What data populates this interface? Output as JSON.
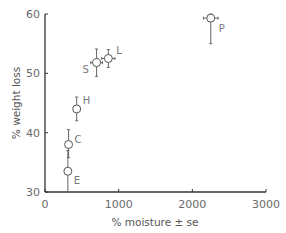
{
  "chart_data": {
    "type": "scatter",
    "title": "",
    "xlabel": "% moisture ± se",
    "ylabel": "% weight loss",
    "xlim": [
      0,
      3000
    ],
    "ylim": [
      30,
      60
    ],
    "xticks": [
      "0",
      "1000",
      "2000",
      "3000"
    ],
    "yticks": [
      "30",
      "40",
      "50",
      "60"
    ],
    "grid": false,
    "legend": null,
    "points": [
      {
        "label": "P",
        "x": 2250,
        "y": 59.3,
        "x_err": 100,
        "y_err_low": 4.3,
        "y_err_high": 0.7
      },
      {
        "label": "L",
        "x": 860,
        "y": 52.5,
        "x_err": 90,
        "y_err_low": 1.5,
        "y_err_high": 1.5
      },
      {
        "label": "S",
        "x": 700,
        "y": 51.8,
        "x_err": 80,
        "y_err_low": 2.3,
        "y_err_high": 2.3
      },
      {
        "label": "H",
        "x": 430,
        "y": 44.0,
        "x_err": 40,
        "y_err_low": 2.0,
        "y_err_high": 2.0
      },
      {
        "label": "C",
        "x": 320,
        "y": 38.0,
        "x_err": 0,
        "y_err_low": 2.2,
        "y_err_high": 2.5
      },
      {
        "label": "E",
        "x": 310,
        "y": 33.5,
        "x_err": 0,
        "y_err_low": 3.5,
        "y_err_high": 3.5
      }
    ]
  },
  "axes": {
    "xlabel": "% moisture ± se",
    "ylabel": "% weight loss",
    "xticks": [
      "0",
      "1000",
      "2000",
      "3000"
    ],
    "yticks": [
      "30",
      "40",
      "50",
      "60"
    ]
  }
}
